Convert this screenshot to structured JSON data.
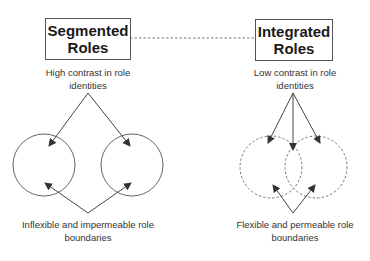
{
  "diagram": {
    "type": "conceptual comparison diagram",
    "colors": {
      "stroke": "#555555",
      "text": "#222222",
      "background": "#ffffff"
    },
    "left": {
      "title": [
        "Segmented",
        "Roles"
      ],
      "top_label": [
        "High contrast in role",
        "identities"
      ],
      "bottom_label": [
        "Inflexible and impermeable role",
        "boundaries"
      ],
      "circle_style": "solid",
      "circles_overlap": false
    },
    "right": {
      "title": [
        "Integrated",
        "Roles"
      ],
      "top_label": [
        "Low contrast in role",
        "identities"
      ],
      "bottom_label": [
        "Flexible and permeable role",
        "boundaries"
      ],
      "circle_style": "dashed",
      "circles_overlap": true
    },
    "connector": {
      "style": "dashed",
      "from": "left.title",
      "to": "right.title"
    }
  }
}
